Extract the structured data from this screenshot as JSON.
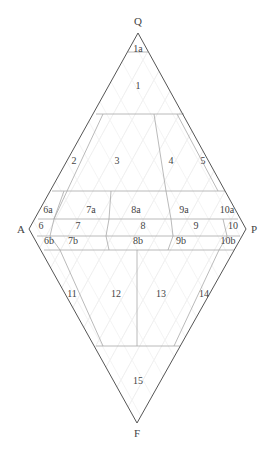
{
  "diagram": {
    "type": "QAPF double-triangle classification diagram",
    "vertices": {
      "Q": {
        "label": "Q",
        "x": 138,
        "y": 22
      },
      "A": {
        "label": "A",
        "x": 21,
        "y": 229
      },
      "P": {
        "label": "P",
        "x": 254,
        "y": 229
      },
      "F": {
        "label": "F",
        "x": 137,
        "y": 434
      }
    },
    "fields": [
      {
        "id": "1a",
        "label": "1a",
        "x": 138,
        "y": 50
      },
      {
        "id": "1",
        "label": "1",
        "x": 138,
        "y": 87
      },
      {
        "id": "2",
        "label": "2",
        "x": 74,
        "y": 162
      },
      {
        "id": "3",
        "label": "3",
        "x": 117,
        "y": 162
      },
      {
        "id": "4",
        "label": "4",
        "x": 171,
        "y": 162
      },
      {
        "id": "5",
        "label": "5",
        "x": 203,
        "y": 162
      },
      {
        "id": "6a",
        "label": "6a",
        "x": 48,
        "y": 211
      },
      {
        "id": "7a",
        "label": "7a",
        "x": 91,
        "y": 211
      },
      {
        "id": "8a",
        "label": "8a",
        "x": 136,
        "y": 211
      },
      {
        "id": "9a",
        "label": "9a",
        "x": 184,
        "y": 211
      },
      {
        "id": "10a",
        "label": "10a",
        "x": 227,
        "y": 211
      },
      {
        "id": "6",
        "label": "6",
        "x": 41,
        "y": 227
      },
      {
        "id": "7",
        "label": "7",
        "x": 78,
        "y": 227
      },
      {
        "id": "8",
        "label": "8",
        "x": 143,
        "y": 227
      },
      {
        "id": "9",
        "label": "9",
        "x": 196,
        "y": 227
      },
      {
        "id": "10",
        "label": "10",
        "x": 233,
        "y": 227
      },
      {
        "id": "6b",
        "label": "6b",
        "x": 49,
        "y": 242
      },
      {
        "id": "7b",
        "label": "7b",
        "x": 73,
        "y": 242
      },
      {
        "id": "8b",
        "label": "8b",
        "x": 138,
        "y": 242
      },
      {
        "id": "9b",
        "label": "9b",
        "x": 181,
        "y": 242
      },
      {
        "id": "10b",
        "label": "10b",
        "x": 228,
        "y": 242
      },
      {
        "id": "11",
        "label": "11",
        "x": 72,
        "y": 295
      },
      {
        "id": "12",
        "label": "12",
        "x": 116,
        "y": 295
      },
      {
        "id": "13",
        "label": "13",
        "x": 161,
        "y": 295
      },
      {
        "id": "14",
        "label": "14",
        "x": 204,
        "y": 295
      },
      {
        "id": "15",
        "label": "15",
        "x": 138,
        "y": 382
      }
    ],
    "colors": {
      "outline": "#555555",
      "field_lines": "#a8a8a8",
      "background_grid": "#ececec",
      "text": "#444444"
    }
  }
}
